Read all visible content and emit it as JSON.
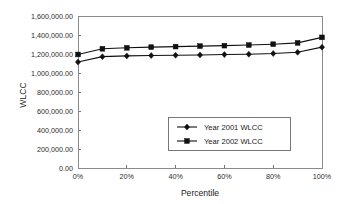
{
  "chart_data": {
    "type": "line",
    "title": "",
    "xlabel": "Percentile",
    "ylabel": "WLCC",
    "xlim": [
      0,
      100
    ],
    "ylim": [
      0,
      1600000
    ],
    "grid": false,
    "legend_position": "center-right-inside",
    "x": [
      0,
      10,
      20,
      30,
      40,
      50,
      60,
      70,
      80,
      90,
      100
    ],
    "xtick_values": [
      0,
      20,
      40,
      60,
      80,
      100
    ],
    "xtick_labels": [
      "0%",
      "20%",
      "40%",
      "60%",
      "80%",
      "100%"
    ],
    "ytick_values": [
      0,
      200000,
      400000,
      600000,
      800000,
      1000000,
      1200000,
      1400000,
      1600000
    ],
    "ytick_labels": [
      "0.00",
      "200,000.00",
      "400,000.00",
      "600,000.00",
      "800,000.00",
      "1,000,000.00",
      "1,200,000.00",
      "1,400,000.00",
      "1,600,000.00"
    ],
    "series": [
      {
        "name": "Year 2001 WLCC",
        "marker": "diamond",
        "color": "#111111",
        "values": [
          1115000,
          1172000,
          1180000,
          1184000,
          1187000,
          1190000,
          1194000,
          1198000,
          1205000,
          1218000,
          1272000
        ]
      },
      {
        "name": "Year 2002 WLCC",
        "marker": "square",
        "color": "#111111",
        "values": [
          1195000,
          1255000,
          1265000,
          1272000,
          1278000,
          1283000,
          1288000,
          1294000,
          1303000,
          1317000,
          1375000
        ]
      }
    ]
  },
  "legend": {
    "entries": [
      {
        "label": "Year 2001 WLCC",
        "marker": "diamond"
      },
      {
        "label": "Year 2002 WLCC",
        "marker": "square"
      }
    ]
  },
  "axes": {
    "y_title": "WLCC",
    "x_title": "Percentile"
  }
}
